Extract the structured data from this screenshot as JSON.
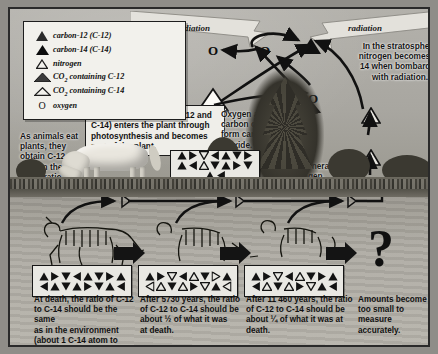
{
  "diagram": {
    "colors": {
      "ink": "#141414",
      "paper": "#efeee9",
      "sky": "#a8a6a0",
      "ground": "#4c4a42"
    }
  },
  "legend": {
    "items": [
      {
        "icon": "filled-triangle-icon",
        "label": "carbon-12 (C-12)"
      },
      {
        "icon": "filled-triangle-dark-icon",
        "label": "carbon-14 (C-14)"
      },
      {
        "icon": "outline-triangle-icon",
        "label": "nitrogen"
      },
      {
        "icon": "filled-wide-triangle-icon",
        "label": "CO2 containing C-12"
      },
      {
        "icon": "outline-wide-triangle-icon",
        "label": "CO2 containing C-14"
      },
      {
        "icon": "oxygen-letter-icon",
        "label": "oxygen"
      }
    ]
  },
  "sky": {
    "radiation_left": "radiation",
    "radiation_right": "radiation",
    "stratosphere_note": "In the stratosphere nitrogen becomes C-14 when bombarded with radiation.",
    "oxygen_note": "Oxygen and carbon combine to form carbon dioxide.",
    "degenerate_note": "C-14 degenerates into nitrogen.",
    "oxygen_symbols": [
      "O",
      "O",
      "O"
    ]
  },
  "surface": {
    "photosynthesis_note": "Carbon dioxide (both C-12 and C-14) enters the plant through photosynthesis and becomes part of the plant.",
    "animals_note": "As animals eat plants, they obtain C-12 and C-14 in the same ratio as the atmosphere."
  },
  "timeline": {
    "stages": [
      {
        "name": "at-death",
        "caption": "At death, the ratio of C-12 to C-14 should be the same as in the environment (about 1 C-14 atom to every 1012 C-12 atoms).",
        "caption_lines": [
          "At death, the ratio of C-12",
          "to C-14 should be the same",
          "as in the environment",
          "(about 1 C-14 atom to",
          "every 10¹² C-12 atoms)."
        ],
        "filled_count": 16,
        "outline_count": 0
      },
      {
        "name": "after-5730-years",
        "caption": "After 5730 years, the ratio of C-12 to C-14 should be about 1/2 of what it was at death.",
        "caption_lines": [
          "After 5730 years, the ratio",
          "of C-12 to C-14 should be",
          "about ½ of what it was",
          "at death."
        ],
        "filled_count": 8,
        "outline_count": 8
      },
      {
        "name": "after-11460-years",
        "caption": "After 11 460 years, the ratio of C-12 to C-14 should be about 1/4 of what it was at death.",
        "caption_lines": [
          "After 11 460 years, the ratio",
          "of C-12 to C-14 should be",
          "about ¼ of what it was at",
          "death."
        ],
        "filled_count": 11,
        "outline_count": 5
      },
      {
        "name": "too-small-to-measure",
        "caption": "Amounts become too small to measure accurately.",
        "caption_lines": [
          "Amounts become",
          "too small to",
          "measure accurately."
        ],
        "symbol": "?"
      }
    ]
  },
  "plant_sample": {
    "name": "plant-carbon-sample",
    "filled_count": 14,
    "outline_count": 2
  }
}
